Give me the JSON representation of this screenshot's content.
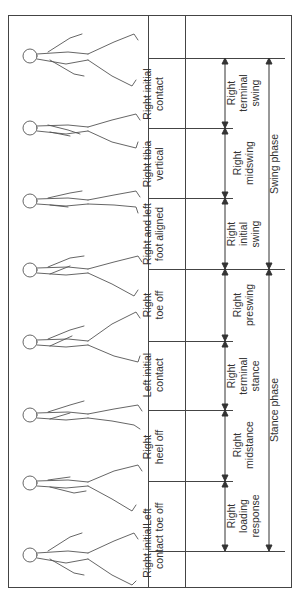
{
  "diagram": {
    "type": "gait-cycle",
    "orientation": "rotated-90-ccw",
    "events": [
      {
        "label": "Right initial\ncontact",
        "tick_y": 551
      },
      {
        "label": "Left\ntoe off",
        "tick_y": 481
      },
      {
        "label": "Right\nheel off",
        "tick_y": 410
      },
      {
        "label": "Left initial\ncontact",
        "tick_y": 341
      },
      {
        "label": "Right\ntoe off",
        "tick_y": 269
      },
      {
        "label": "Right and left\nfoot aligned",
        "tick_y": 198
      },
      {
        "label": "Right tibia\nvertical",
        "tick_y": 128
      },
      {
        "label": "Right initial\ncontact",
        "tick_y": 58
      }
    ],
    "subphases": [
      {
        "label": "Right\nloading\nresponse"
      },
      {
        "label": "Right\nmidstance"
      },
      {
        "label": "Right\nterminal\nstance"
      },
      {
        "label": "Right\npreswing"
      },
      {
        "label": "Right\ninitial\nswing"
      },
      {
        "label": "Right\nmidswing"
      },
      {
        "label": "Right\nterminal\nswing"
      }
    ],
    "phases": [
      {
        "label": "Stance phase"
      },
      {
        "label": "Swing phase"
      }
    ],
    "figure_count": 8,
    "line_color": "#444444"
  }
}
